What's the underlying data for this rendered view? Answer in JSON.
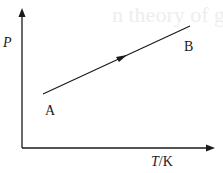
{
  "background_text": "n theory of gases",
  "axes": {
    "y_label": "P",
    "x_label_var": "T",
    "x_label_unit": "/K"
  },
  "points": {
    "start": "A",
    "end": "B"
  },
  "colors": {
    "line": "#1a1a1a",
    "background": "#ffffff"
  }
}
